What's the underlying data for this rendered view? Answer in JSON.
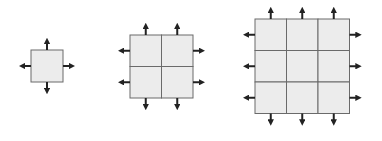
{
  "diagram": {
    "colors": {
      "cell_fill": "#ececec",
      "cell_stroke": "#6a6a6a",
      "arrow": "#222222"
    },
    "grids": [
      {
        "name": "grid-1x1",
        "n": 1,
        "x": 31,
        "y": 50,
        "cell": 32
      },
      {
        "name": "grid-2x2",
        "n": 2,
        "x": 130,
        "y": 35,
        "cell": 31.5
      },
      {
        "name": "grid-3x3",
        "n": 3,
        "x": 255,
        "y": 19,
        "cell": 31.5
      }
    ]
  }
}
